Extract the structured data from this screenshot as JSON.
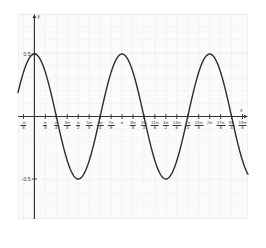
{
  "figure": {
    "kind": "math-plot",
    "background_color": "#ffffff",
    "plot_background_color": "#fbfbfb",
    "grid_color": "#d8d8d8",
    "axis_color": "#333333",
    "curve_color": "#2b2b2b"
  },
  "axis_labels": {
    "x": "x",
    "y": "y"
  },
  "y_ticks": [
    {
      "value": 0.5,
      "label": "0.5"
    },
    {
      "value": -0.5,
      "label": "-0.5"
    }
  ],
  "x_ticks": [
    {
      "value": -0.3926990817,
      "num": "-π",
      "den": "8"
    },
    {
      "value": 0.3926990817,
      "num": "π",
      "den": "8"
    },
    {
      "value": 0.7853981634,
      "num": "π",
      "den": "4"
    },
    {
      "value": 1.1780972451,
      "num": "3π",
      "den": "8"
    },
    {
      "value": 1.5707963268,
      "num": "π",
      "den": "2"
    },
    {
      "value": 1.9634954085,
      "num": "5π",
      "den": "8"
    },
    {
      "value": 2.3561944902,
      "num": "3π",
      "den": "4"
    },
    {
      "value": 2.7488935719,
      "num": "7π",
      "den": "8"
    },
    {
      "value": 3.1415926536,
      "plain": "π"
    },
    {
      "value": 3.5342917353,
      "num": "9π",
      "den": "8"
    },
    {
      "value": 3.926990817,
      "num": "5π",
      "den": "4"
    },
    {
      "value": 4.3196898987,
      "num": "11π",
      "den": "8"
    },
    {
      "value": 4.7123889804,
      "num": "3π",
      "den": "2"
    },
    {
      "value": 5.1050880621,
      "num": "13π",
      "den": "8"
    },
    {
      "value": 5.4977871438,
      "num": "7π",
      "den": "4"
    },
    {
      "value": 5.8904862255,
      "num": "15π",
      "den": "8"
    },
    {
      "value": 6.2831853072,
      "plain": "2π"
    },
    {
      "value": 6.6758843889,
      "num": "17π",
      "den": "8"
    },
    {
      "value": 7.0685834706,
      "num": "9π",
      "den": "4"
    },
    {
      "value": 7.4612825523,
      "num": "19π",
      "den": "8"
    }
  ],
  "chart_data": {
    "type": "line",
    "title": "",
    "xlabel": "x",
    "ylabel": "y",
    "function": "y = 0.5 cos(2x)",
    "amplitude": 0.5,
    "period_value": 3.1415926536,
    "period_label": "π",
    "xlim": [
      -0.5890486226,
      7.6576320657
    ],
    "ylim": [
      -0.82,
      0.82
    ],
    "grid": true,
    "legend": "none",
    "x": [
      -0.3927,
      -0.2945,
      -0.1963,
      -0.0982,
      0.0,
      0.0982,
      0.1963,
      0.2945,
      0.3927,
      0.4909,
      0.589,
      0.6872,
      0.7854,
      0.8836,
      0.9817,
      1.0799,
      1.1781,
      1.2763,
      1.3744,
      1.4726,
      1.5708,
      1.669,
      1.7671,
      1.8653,
      1.9635,
      2.0617,
      2.1598,
      2.258,
      2.3562,
      2.4544,
      2.5525,
      2.6507,
      2.7489,
      2.8471,
      2.9452,
      3.0434,
      3.1416,
      3.2398,
      3.3379,
      3.4361,
      3.5343,
      3.6325,
      3.7306,
      3.8288,
      3.927,
      4.0252,
      4.1233,
      4.2215,
      4.3197,
      4.4179,
      4.516,
      4.6142,
      4.7124,
      4.8106,
      4.9087,
      5.0069,
      5.1051,
      5.2033,
      5.3014,
      5.3996,
      5.4978,
      5.596,
      5.6941,
      5.7923,
      5.8905,
      5.9887,
      6.0868,
      6.185,
      6.2832,
      6.3814,
      6.4795,
      6.5777,
      6.6759,
      6.7741,
      6.8722,
      6.9704,
      7.0686,
      7.1668,
      7.2649,
      7.3631,
      7.4613
    ],
    "y": [
      0.3536,
      0.4157,
      0.4619,
      0.4904,
      0.5,
      0.4904,
      0.4619,
      0.4157,
      0.3536,
      0.2778,
      0.1913,
      0.0975,
      0.0,
      -0.0975,
      -0.1913,
      -0.2778,
      -0.3536,
      -0.4157,
      -0.4619,
      -0.4904,
      -0.5,
      -0.4904,
      -0.4619,
      -0.4157,
      -0.3536,
      -0.2778,
      -0.1913,
      -0.0975,
      0.0,
      0.0975,
      0.1913,
      0.2778,
      0.3536,
      0.4157,
      0.4619,
      0.4904,
      0.5,
      0.4904,
      0.4619,
      0.4157,
      0.3536,
      0.2778,
      0.1913,
      0.0975,
      0.0,
      -0.0975,
      -0.1913,
      -0.2778,
      -0.3536,
      -0.4157,
      -0.4619,
      -0.4904,
      -0.5,
      -0.4904,
      -0.4619,
      -0.4157,
      -0.3536,
      -0.2778,
      -0.1913,
      -0.0975,
      0.0,
      0.0975,
      0.1913,
      0.2778,
      0.3536,
      0.4157,
      0.4619,
      0.4904,
      0.5,
      0.4904,
      0.4619,
      0.4157,
      0.3536,
      0.2778,
      0.1913,
      0.0975,
      0.0,
      -0.0975,
      -0.1913,
      -0.2778,
      -0.3536
    ],
    "maxima": [
      {
        "x": 0.0,
        "y": 0.5
      },
      {
        "x": 3.1415926536,
        "y": 0.5
      },
      {
        "x": 6.2831853072,
        "y": 0.5
      }
    ],
    "minima": [
      {
        "x": 1.5707963268,
        "y": -0.5
      },
      {
        "x": 4.7123889804,
        "y": -0.5
      }
    ],
    "zeros": [
      0.7853981634,
      2.3561944902,
      3.926990817,
      5.4977871438,
      7.0685834706
    ]
  }
}
